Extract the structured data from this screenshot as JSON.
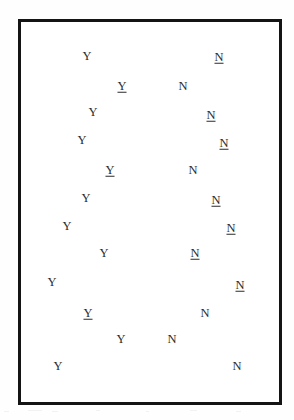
{
  "figure": {
    "kind": "scatter-of-labels",
    "frame": {
      "x": 18,
      "y": 19,
      "width": 264,
      "height": 386,
      "border_color": "#141414",
      "border_width": 3
    },
    "background_color": "#ffffff",
    "text_color": "#2b2b2b",
    "label_font_size": 12.5
  },
  "chart_data": {
    "type": "scatter",
    "title": "",
    "subtitle": "",
    "xlabel": "",
    "ylabel": "",
    "grid": false,
    "legend": null,
    "axis_ticks": [],
    "xlim": [
      18,
      282
    ],
    "ylim": [
      19,
      405
    ],
    "note": "Two vertical clusters of single-character labels inside a plain rectangular frame. Left cluster is the letter Y, right cluster is the letter N. Some labels are underlined.",
    "series": [
      {
        "name": "Y",
        "label": "Y",
        "underlined_count": 3,
        "count": 12,
        "points": [
          {
            "label": "Y",
            "x": 87,
            "y": 56,
            "underlined": false
          },
          {
            "label": "Y",
            "x": 122,
            "y": 86,
            "underlined": true
          },
          {
            "label": "Y",
            "x": 93,
            "y": 112,
            "underlined": false
          },
          {
            "label": "Y",
            "x": 82,
            "y": 140,
            "underlined": false
          },
          {
            "label": "Y",
            "x": 110,
            "y": 170,
            "underlined": true
          },
          {
            "label": "Y",
            "x": 86,
            "y": 198,
            "underlined": false
          },
          {
            "label": "Y",
            "x": 67,
            "y": 226,
            "underlined": false
          },
          {
            "label": "Y",
            "x": 104,
            "y": 253,
            "underlined": false
          },
          {
            "label": "Y",
            "x": 52,
            "y": 282,
            "underlined": false
          },
          {
            "label": "Y",
            "x": 88,
            "y": 313,
            "underlined": true
          },
          {
            "label": "Y",
            "x": 121,
            "y": 339,
            "underlined": false
          },
          {
            "label": "Y",
            "x": 58,
            "y": 366,
            "underlined": false
          }
        ]
      },
      {
        "name": "N",
        "label": "N",
        "underlined_count": 7,
        "count": 12,
        "points": [
          {
            "label": "N",
            "x": 219,
            "y": 57,
            "underlined": true
          },
          {
            "label": "N",
            "x": 183,
            "y": 86,
            "underlined": false
          },
          {
            "label": "N",
            "x": 211,
            "y": 115,
            "underlined": true
          },
          {
            "label": "N",
            "x": 224,
            "y": 143,
            "underlined": true
          },
          {
            "label": "N",
            "x": 193,
            "y": 170,
            "underlined": false
          },
          {
            "label": "N",
            "x": 216,
            "y": 200,
            "underlined": true
          },
          {
            "label": "N",
            "x": 231,
            "y": 228,
            "underlined": true
          },
          {
            "label": "N",
            "x": 195,
            "y": 253,
            "underlined": true
          },
          {
            "label": "N",
            "x": 240,
            "y": 285,
            "underlined": true
          },
          {
            "label": "N",
            "x": 205,
            "y": 313,
            "underlined": false
          },
          {
            "label": "N",
            "x": 172,
            "y": 339,
            "underlined": false
          },
          {
            "label": "N",
            "x": 237,
            "y": 366,
            "underlined": false
          }
        ]
      }
    ]
  },
  "artifacts": {
    "description": "faint scanner speckles below the frame, no legible text",
    "speckles": [
      {
        "x": 4,
        "y": 411,
        "width": 5
      },
      {
        "x": 28,
        "y": 410,
        "width": 14
      },
      {
        "x": 52,
        "y": 411,
        "width": 6
      },
      {
        "x": 96,
        "y": 410,
        "width": 4
      },
      {
        "x": 146,
        "y": 411,
        "width": 3
      },
      {
        "x": 190,
        "y": 410,
        "width": 7
      },
      {
        "x": 236,
        "y": 411,
        "width": 5
      }
    ]
  }
}
